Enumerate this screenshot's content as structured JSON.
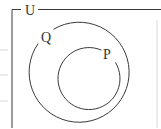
{
  "diagram": {
    "type": "venn",
    "universal_set": {
      "label": "U"
    },
    "sets": [
      {
        "id": "Q",
        "label": "Q",
        "contains": [
          "P"
        ]
      },
      {
        "id": "P",
        "label": "P",
        "subset_of": "Q"
      }
    ],
    "colors": {
      "stroke": "#3a3a3a",
      "text": "#333333",
      "background": "#ffffff"
    }
  }
}
